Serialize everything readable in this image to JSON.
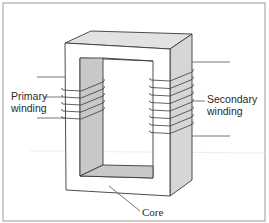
{
  "diagram": {
    "labels": {
      "primary_line1": "Primary",
      "primary_line2": "winding",
      "secondary_line1": "Secondary",
      "secondary_line2": "winding",
      "core": "Core"
    },
    "primary_turns": 5,
    "secondary_turns": 8,
    "colors": {
      "stroke": "#3a3a3a",
      "shade": "#c8c8c8",
      "top_face": "#e2e2e2",
      "side_face": "#d6d6d6",
      "frame": "#9a9a9a"
    }
  }
}
